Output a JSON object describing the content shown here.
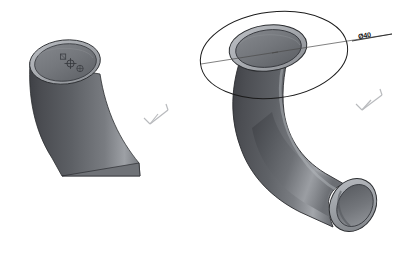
{
  "scene": {
    "title": "CAD 3D pipe elbow models",
    "background_color": "#ffffff",
    "viewport": {
      "width": 409,
      "height": 263
    }
  },
  "models": [
    {
      "name": "left-pipe-model",
      "description": "Swept pipe solid, clipped at view bottom, circular top face with annular wall",
      "body_fill_dark": "#4e5055",
      "body_fill_mid": "#6b6e73",
      "body_fill_light": "#9fa3a8",
      "top_face_fill": "#7a7d82",
      "rim_fill": "#b0b3b8",
      "edge_color": "#2b2d30"
    },
    {
      "name": "right-pipe-model",
      "description": "Swept 90 degree pipe elbow with open ends, sketch circle on top plane",
      "body_fill_dark": "#4e5055",
      "body_fill_mid": "#6b6e73",
      "body_fill_light": "#a8abb0",
      "top_face_fill": "#76797e",
      "rim_fill": "#aeb1b6",
      "edge_color": "#2b2d30"
    }
  ],
  "sketch": {
    "name": "sketch-circle",
    "entity_type": "circle",
    "edge_color": "#1b1b1b",
    "centerline_color": "#4a4a4a"
  },
  "annotations": {
    "diameter_dimension": {
      "label": "Ø40",
      "symbol": "Ø",
      "value": "40",
      "color": "#111111",
      "leader_color": "#1b1b1b"
    }
  },
  "origin_triads": [
    {
      "name": "origin-triad-left",
      "color": "#8e9196"
    },
    {
      "name": "origin-triad-right",
      "color": "#8e9196"
    }
  ]
}
